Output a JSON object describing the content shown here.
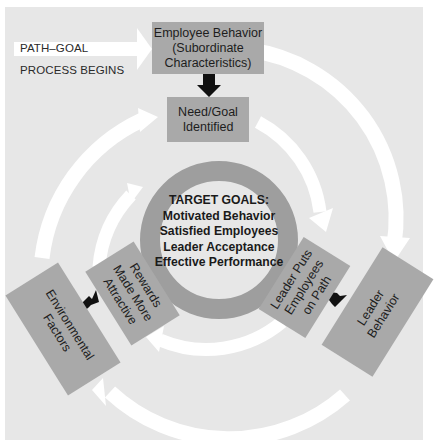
{
  "diagram": {
    "start": {
      "line1": "PATH–GOAL",
      "line2": "PROCESS BEGINS"
    },
    "boxes": {
      "employee_behavior": {
        "line1": "Employee Behavior",
        "line2": "(Subordinate",
        "line3": "Characteristics)"
      },
      "need_goal": {
        "line1": "Need/Goal",
        "line2": "Identified"
      },
      "leader_puts": {
        "line1": "Leader Puts",
        "line2": "Employees",
        "line3": "on Path"
      },
      "leader_behavior": {
        "line1": "Leader",
        "line2": "Behavior"
      },
      "rewards": {
        "line1": "Rewards",
        "line2": "Made More",
        "line3": "Attractive"
      },
      "environmental": {
        "line1": "Environmental",
        "line2": "Factors"
      }
    },
    "target_goals": {
      "title": "TARGET GOALS:",
      "items": [
        "Motivated Behavior",
        "Satisfied Employees",
        "Leader Acceptance",
        "Effective Performance"
      ]
    },
    "colors": {
      "background": "#e7e7e7",
      "box": "#a9a9a9",
      "ring": "#9e9e9e",
      "arrow_flow": "#ffffff",
      "arrow_dark": "#111111"
    }
  }
}
